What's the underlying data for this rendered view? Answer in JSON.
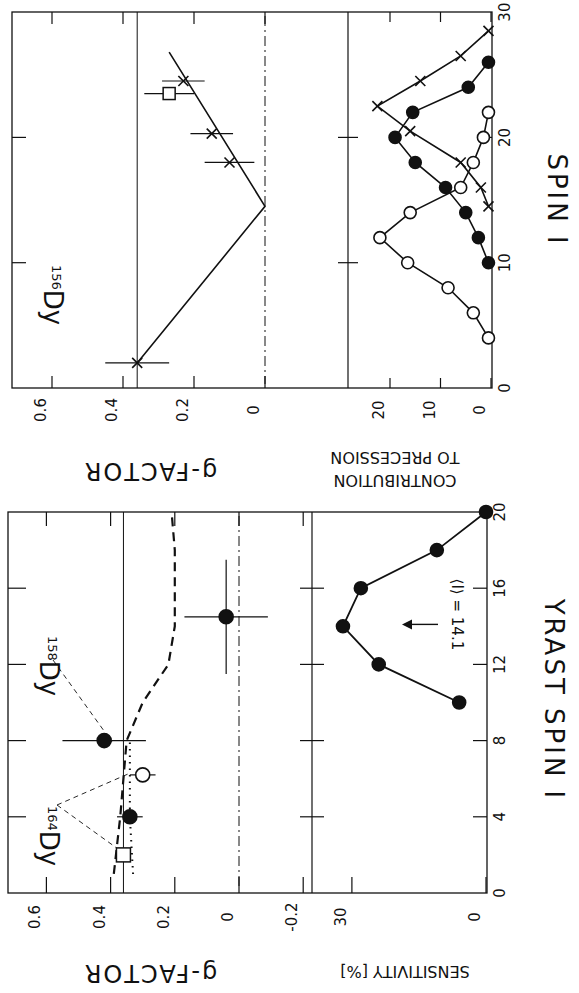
{
  "figure": {
    "rotation_deg": 90,
    "ink_color": "#111111",
    "background": "#ffffff"
  },
  "chart_data": [
    {
      "id": "dy156",
      "type": "line",
      "title": "156Dy",
      "nucleus_label": {
        "mass": "156",
        "element": "Dy"
      },
      "upper_panel": {
        "ylabel": "g-FACTOR",
        "yticks": [
          "0.6",
          "0.4",
          "0.2",
          "0"
        ],
        "ylim": [
          0,
          0.7
        ],
        "reference_line_g": 0.36,
        "zero_line_style": "dash-dot",
        "series": [
          {
            "name": "measured g (crosses)",
            "marker": "x",
            "points": [
              {
                "spin": 2,
                "g": 0.36,
                "g_err": 0.09,
                "spin_err": 0
              },
              {
                "spin": 18,
                "g": 0.1,
                "g_err": 0.07
              },
              {
                "spin": 20.3,
                "g": 0.15,
                "g_err": 0.06
              },
              {
                "spin": 24.5,
                "g": 0.23,
                "g_err": 0.06
              }
            ]
          },
          {
            "name": "square point",
            "marker": "square-open",
            "points": [
              {
                "spin": 23.5,
                "g": 0.27,
                "g_err": 0.07
              }
            ]
          },
          {
            "name": "fit line",
            "style": "solid",
            "points": [
              {
                "spin": 2,
                "g": 0.36
              },
              {
                "spin": 14.5,
                "g": 0.0
              },
              {
                "spin": 26.8,
                "g": 0.27
              }
            ]
          }
        ]
      },
      "lower_panel": {
        "ylabel": "CONTRIBUTION TO PRECESSION",
        "yticks": [
          "20",
          "10",
          "0"
        ],
        "xlabel": "SPIN I",
        "xticks": [
          "0",
          "10",
          "20",
          "30"
        ],
        "xlim": [
          0,
          30
        ],
        "series": [
          {
            "name": "open circles",
            "marker": "circle-open",
            "points": [
              [
                4,
                0.5
              ],
              [
                6,
                3.5
              ],
              [
                8,
                8.5
              ],
              [
                10,
                16.5
              ],
              [
                12,
                22
              ],
              [
                14,
                16
              ],
              [
                16,
                6
              ],
              [
                18,
                3.5
              ],
              [
                20,
                1.5
              ],
              [
                22,
                0.5
              ]
            ]
          },
          {
            "name": "filled circles",
            "marker": "circle-filled",
            "points": [
              [
                10,
                0.5
              ],
              [
                12,
                2.5
              ],
              [
                14,
                5
              ],
              [
                16,
                9
              ],
              [
                18,
                15
              ],
              [
                20,
                19
              ],
              [
                22,
                15.5
              ],
              [
                24,
                4.5
              ],
              [
                26,
                0.5
              ]
            ]
          },
          {
            "name": "crosses",
            "marker": "x",
            "points": [
              [
                14.5,
                0.5
              ],
              [
                16,
                2
              ],
              [
                18,
                6
              ],
              [
                20.5,
                16
              ],
              [
                22.5,
                22.5
              ],
              [
                24.5,
                14
              ],
              [
                26.5,
                6
              ],
              [
                28.5,
                0.5
              ]
            ]
          }
        ]
      },
      "grid": false
    },
    {
      "id": "dy158_164",
      "type": "scatter",
      "title": "158Dy / 164Dy",
      "nucleus_labels": [
        {
          "mass": "158",
          "element": "Dy"
        },
        {
          "mass": "164",
          "element": "Dy"
        }
      ],
      "upper_panel": {
        "ylabel": "g-FACTOR",
        "yticks": [
          "0.6",
          "0.4",
          "0.2",
          "0",
          "-0.2"
        ],
        "ylim": [
          -0.25,
          0.7
        ],
        "reference_line_g": 0.36,
        "zero_line_style": "dash-dot",
        "series": [
          {
            "name": "158Dy filled circles",
            "marker": "circle-filled",
            "points": [
              {
                "spin": 8,
                "g": 0.42,
                "g_err": 0.13
              },
              {
                "spin": 14.5,
                "g": 0.04,
                "g_err": 0.13,
                "spin_err": 3
              }
            ]
          },
          {
            "name": "164Dy filled circle",
            "marker": "circle-filled",
            "points": [
              {
                "spin": 4,
                "g": 0.34,
                "g_err": 0.04
              }
            ]
          },
          {
            "name": "164Dy open circle",
            "marker": "circle-open",
            "points": [
              {
                "spin": 6.2,
                "g": 0.3,
                "g_err": 0.04
              }
            ]
          },
          {
            "name": "164Dy square",
            "marker": "square-open",
            "points": [
              {
                "spin": 2,
                "g": 0.36
              }
            ]
          },
          {
            "name": "theory dashed",
            "style": "dashed",
            "points": [
              [
                1,
                0.39
              ],
              [
                4,
                0.37
              ],
              [
                8,
                0.35
              ],
              [
                10,
                0.3
              ],
              [
                12,
                0.22
              ],
              [
                14,
                0.2
              ],
              [
                18,
                0.2
              ],
              [
                20,
                0.21
              ]
            ]
          },
          {
            "name": "theory dotted",
            "style": "dotted",
            "points": [
              [
                1,
                0.33
              ],
              [
                4,
                0.34
              ],
              [
                8,
                0.34
              ]
            ]
          }
        ]
      },
      "lower_panel": {
        "ylabel": "SENSITIVITY [%]",
        "yticks": [
          "30",
          "0"
        ],
        "xlabel": "YRAST SPIN I",
        "xticks": [
          "0",
          "4",
          "8",
          "12",
          "16",
          "20"
        ],
        "xlim": [
          0,
          20
        ],
        "annotation": "⟨I⟩ = 14.1",
        "arrow_at_spin": 14.1,
        "series": [
          {
            "name": "sensitivity",
            "marker": "circle-filled",
            "points": [
              [
                10,
                6
              ],
              [
                12,
                24
              ],
              [
                14,
                32
              ],
              [
                16,
                28
              ],
              [
                18,
                11
              ],
              [
                20,
                0
              ]
            ]
          }
        ]
      },
      "grid": false
    }
  ],
  "text": {
    "top_nucleus_mass": "156",
    "top_nucleus_el": "Dy",
    "top_gfactor_label": "g-FACTOR",
    "top_contrib_label_1": "CONTRIBUTION",
    "top_contrib_label_2": "TO PRECESSION",
    "top_spin_label": "SPIN I",
    "bot_158_mass": "158",
    "bot_158_el": "Dy",
    "bot_164_mass": "164",
    "bot_164_el": "Dy",
    "bot_gfactor_label": "g-FACTOR",
    "bot_sens_label": "SENSITIVITY [%]",
    "bot_spin_label": "YRAST SPIN I",
    "bot_annotation": "⟨I⟩ = 14.1",
    "top_gticks": [
      "0.6",
      "0.4",
      "0.2",
      "0"
    ],
    "top_cticks": [
      "20",
      "10",
      "0"
    ],
    "top_sticks": [
      "0",
      "10",
      "20",
      "30"
    ],
    "bot_gticks": [
      "0.6",
      "0.4",
      "0.2",
      "0",
      "-0.2"
    ],
    "bot_sensticks": [
      "30",
      "0"
    ],
    "bot_sticks": [
      "0",
      "4",
      "8",
      "12",
      "16",
      "20"
    ]
  }
}
